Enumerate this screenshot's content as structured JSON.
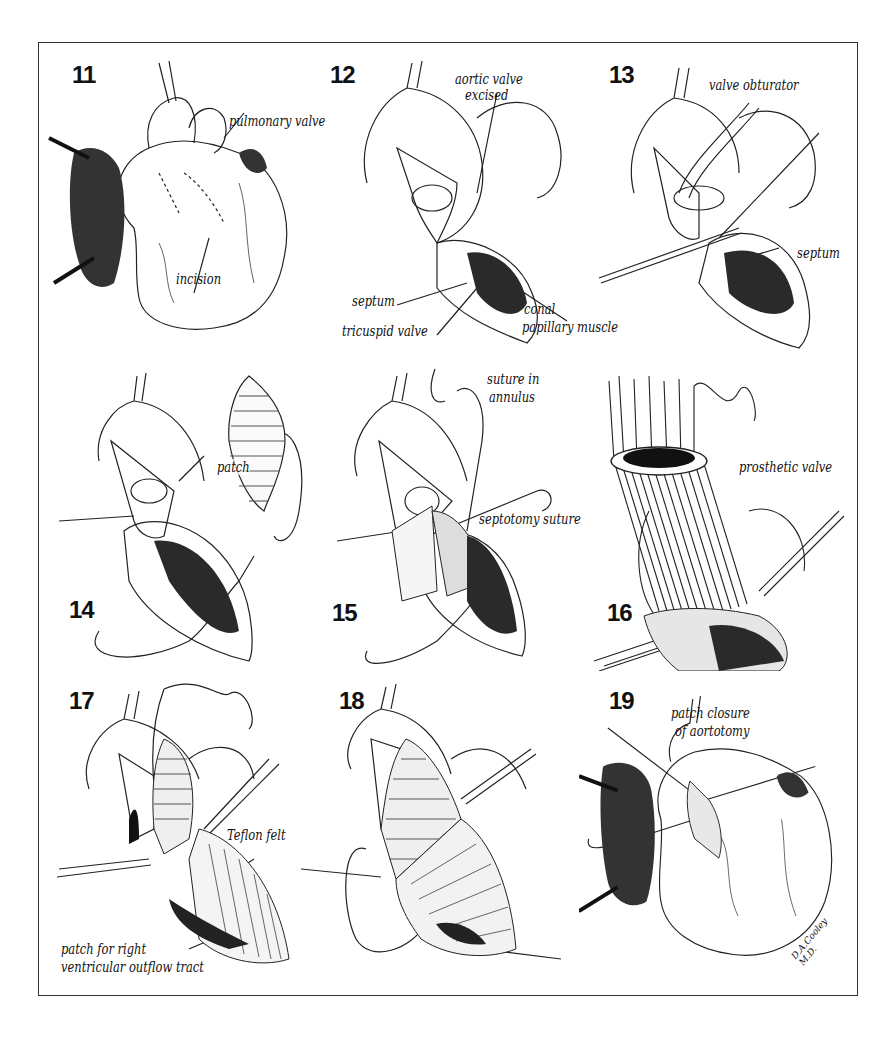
{
  "figure": {
    "panels": [
      {
        "number": "11",
        "labels": [
          "pulmonary valve",
          "incision"
        ]
      },
      {
        "number": "12",
        "labels": [
          "aortic valve",
          "excised",
          "septum",
          "tricuspid valve",
          "conal",
          "papillary muscle"
        ]
      },
      {
        "number": "13",
        "labels": [
          "valve obturator",
          "septum"
        ]
      },
      {
        "number": "14",
        "labels": [
          "patch"
        ]
      },
      {
        "number": "15",
        "labels": [
          "suture in",
          "annulus",
          "septotomy suture"
        ]
      },
      {
        "number": "16",
        "labels": [
          "prosthetic valve"
        ]
      },
      {
        "number": "17",
        "labels": [
          "Teflon felt",
          "patch for right",
          "ventricular outflow tract"
        ]
      },
      {
        "number": "18",
        "labels": []
      },
      {
        "number": "19",
        "labels": [
          "patch closure",
          "of aortotomy"
        ]
      }
    ],
    "signature": "D.A.Cooley M.D."
  }
}
